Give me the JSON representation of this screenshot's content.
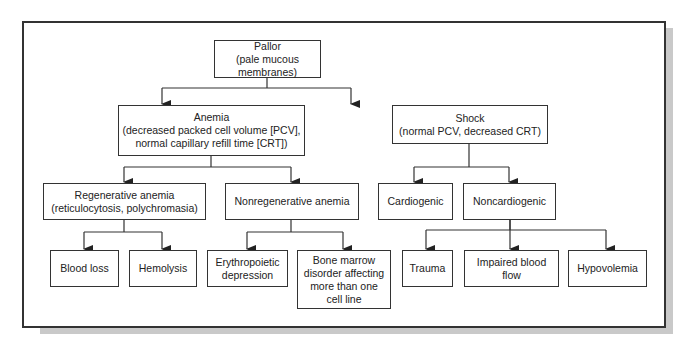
{
  "diagram": {
    "nodes": {
      "pallor": {
        "line1": "Pallor",
        "line2": "(pale mucous membranes)"
      },
      "anemia": {
        "line1": "Anemia",
        "line2": "(decreased packed cell volume [PCV],",
        "line3": "normal capillary refill time [CRT])"
      },
      "shock": {
        "line1": "Shock",
        "line2": "(normal PCV, decreased CRT)"
      },
      "regenerative": {
        "line1": "Regenerative anemia",
        "line2": "(reticulocytosis, polychromasia)"
      },
      "nonregenerative": {
        "line1": "Nonregenerative anemia"
      },
      "cardiogenic": {
        "line1": "Cardiogenic"
      },
      "noncardiogenic": {
        "line1": "Noncardiogenic"
      },
      "blood_loss": {
        "line1": "Blood loss"
      },
      "hemolysis": {
        "line1": "Hemolysis"
      },
      "erythropoietic": {
        "line1": "Erythropoietic",
        "line2": "depression"
      },
      "bone_marrow": {
        "line1": "Bone marrow",
        "line2": "disorder affecting",
        "line3": "more than one",
        "line4": "cell line"
      },
      "trauma": {
        "line1": "Trauma"
      },
      "impaired": {
        "line1": "Impaired blood",
        "line2": "flow"
      },
      "hypovolemia": {
        "line1": "Hypovolemia"
      }
    },
    "edges": [
      [
        "pallor",
        "anemia"
      ],
      [
        "pallor",
        "shock"
      ],
      [
        "anemia",
        "regenerative"
      ],
      [
        "anemia",
        "nonregenerative"
      ],
      [
        "shock",
        "cardiogenic"
      ],
      [
        "shock",
        "noncardiogenic"
      ],
      [
        "regenerative",
        "blood_loss"
      ],
      [
        "regenerative",
        "hemolysis"
      ],
      [
        "nonregenerative",
        "erythropoietic"
      ],
      [
        "nonregenerative",
        "bone_marrow"
      ],
      [
        "noncardiogenic",
        "trauma"
      ],
      [
        "noncardiogenic",
        "impaired"
      ],
      [
        "noncardiogenic",
        "hypovolemia"
      ]
    ]
  }
}
